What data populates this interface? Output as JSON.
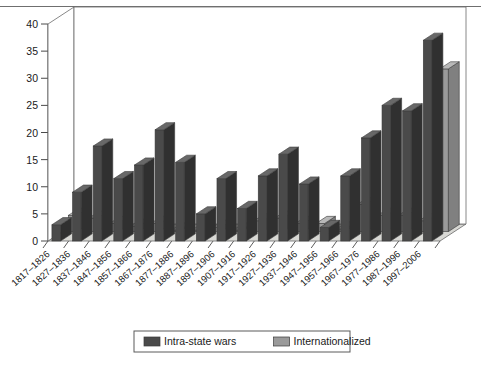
{
  "chart_data": {
    "type": "bar",
    "title": "",
    "subtitle": "",
    "xlabel": "",
    "ylabel": "",
    "ylim": [
      0,
      40
    ],
    "yticks": [
      0,
      5,
      10,
      15,
      20,
      25,
      30,
      35,
      40
    ],
    "grid": false,
    "legend_position": "bottom",
    "projection": "3d",
    "categories": [
      "1817–1826",
      "1827–1836",
      "1837–1846",
      "1847–1856",
      "1857–1866",
      "1867–1876",
      "1877–1886",
      "1887–1896",
      "1897–1906",
      "1907–1916",
      "1917–1926",
      "1927–1936",
      "1937–1946",
      "1947–1956",
      "1957–1966",
      "1967–1976",
      "1977–1986",
      "1987–1996",
      "1997–2006"
    ],
    "series": [
      {
        "name": "Intra-state wars",
        "color": "#4a4a4a",
        "values": [
          3,
          9,
          17.5,
          11.5,
          14,
          20.5,
          14.5,
          5,
          11.5,
          6,
          12,
          16,
          10.5,
          2.5,
          12,
          19,
          25,
          24,
          37
        ]
      },
      {
        "name": "Internationalized",
        "color": "#9a9a9a",
        "values": [
          3,
          2.5,
          1.5,
          1,
          1.5,
          0.3,
          0.3,
          0.8,
          0.3,
          2,
          2.5,
          1.5,
          1.5,
          0.5,
          5,
          3,
          3,
          2,
          30
        ]
      }
    ]
  },
  "legend": {
    "items": [
      {
        "label": "Intra-state wars",
        "color": "#4a4a4a"
      },
      {
        "label": "Internationalized",
        "color": "#9a9a9a"
      }
    ]
  }
}
